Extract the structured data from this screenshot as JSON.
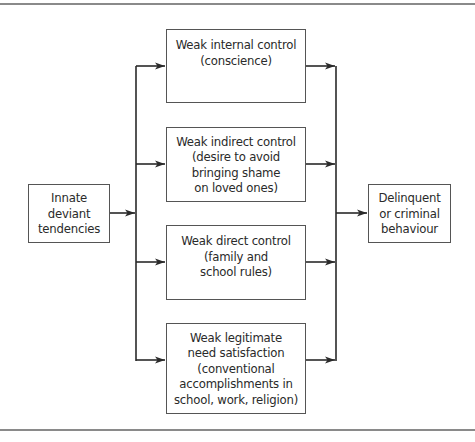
{
  "diagram": {
    "source": {
      "label": "Innate\ndeviant\ntendencies"
    },
    "controls": [
      {
        "label": "Weak internal control\n(conscience)"
      },
      {
        "label": "Weak indirect control\n(desire to avoid\nbringing shame\non loved ones)"
      },
      {
        "label": "Weak direct control\n(family and\nschool rules)"
      },
      {
        "label": "Weak legitimate\nneed satisfaction\n(conventional\naccomplishments in\nschool, work, religion)"
      }
    ],
    "outcome": {
      "label": "Delinquent\nor criminal\nbehaviour"
    },
    "colors": {
      "line": "#2a2a2a",
      "border": "#555555",
      "rule": "#8a8a8a"
    }
  }
}
